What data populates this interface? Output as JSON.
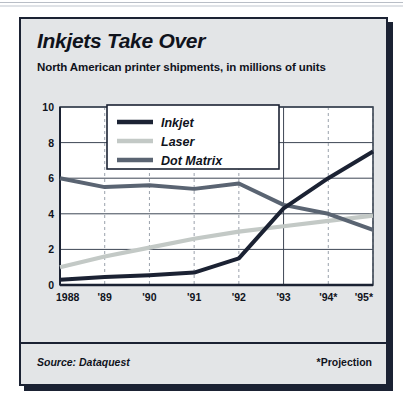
{
  "card": {
    "title": "Inkjets Take Over",
    "subtitle": "North American printer shipments, in millions of units",
    "source": "Source: Dataquest",
    "projection_note": "*Projection"
  },
  "colors": {
    "card_bg": "#e3e5e7",
    "frame": "#1b2233",
    "plot_bg": "#ffffff",
    "inkjet": "#1b2233",
    "laser": "#c3c9c6",
    "dot_matrix": "#5a6472",
    "gridline": "#3d4654",
    "dashed_gridline": "#9aa1ab"
  },
  "chart_data": {
    "type": "line",
    "title": "Inkjets Take Over",
    "subtitle": "North American printer shipments, in millions of units",
    "xlabel": "",
    "ylabel": "",
    "ylim": [
      0,
      10
    ],
    "yticks": [
      0,
      2,
      4,
      6,
      8,
      10
    ],
    "ytick_labels": [
      "0",
      "2",
      "4",
      "6",
      "8",
      "10"
    ],
    "categories": [
      "1988",
      "'89",
      "'90",
      "'91",
      "'92",
      "'93",
      "'94*",
      "'95*"
    ],
    "grid": "horizontal solid at yticks, vertical dashed at odd years, solid vertical at '93",
    "legend_position": "top-center inside plot",
    "series": [
      {
        "name": "Inkjet",
        "color": "#1b2233",
        "values": [
          0.3,
          0.45,
          0.55,
          0.7,
          1.5,
          4.3,
          6.0,
          7.5
        ]
      },
      {
        "name": "Laser",
        "color": "#c3c9c6",
        "values": [
          1.0,
          1.6,
          2.1,
          2.6,
          3.0,
          3.3,
          3.6,
          3.9
        ]
      },
      {
        "name": "Dot Matrix",
        "color": "#5a6472",
        "values": [
          6.0,
          5.5,
          5.6,
          5.4,
          5.7,
          4.5,
          4.0,
          3.1
        ]
      }
    ],
    "annotations": [
      "*Projection"
    ],
    "source": "Dataquest"
  }
}
